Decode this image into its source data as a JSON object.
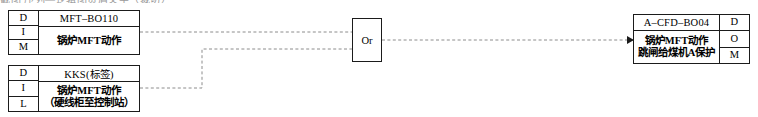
{
  "diagram": {
    "type": "logic-diagram",
    "top_clipped_text": "截图   序列—逻辑图页眉文字（裁切）",
    "blocks": [
      {
        "id": "block-mft-bo110",
        "key_side": "left",
        "keys": [
          "D",
          "I",
          "M"
        ],
        "title": "MFT–BO110",
        "description_lines": [
          "锅炉MFT动作"
        ]
      },
      {
        "id": "block-kks-tag",
        "key_side": "left",
        "keys": [
          "D",
          "I",
          "L"
        ],
        "title": "KKS(标签)",
        "description_lines": [
          "锅炉MFT动作",
          "（硬线柜至控制站）"
        ]
      },
      {
        "id": "block-a-cfd-bo04",
        "key_side": "right",
        "keys": [
          "D",
          "O",
          "M"
        ],
        "title": "A–CFD–BO04",
        "description_lines": [
          "锅炉MFT动作",
          "跳闸给煤机A保护"
        ]
      }
    ],
    "gate": {
      "id": "gate-or",
      "label": "Or",
      "inputs": 2,
      "outputs": 1
    },
    "connections": [
      {
        "from": "block-mft-bo110",
        "to": "gate-or",
        "style": "dashed"
      },
      {
        "from": "block-kks-tag",
        "to": "gate-or",
        "style": "dashed"
      },
      {
        "from": "gate-or",
        "to": "block-a-cfd-bo04",
        "style": "dashed"
      }
    ],
    "colors": {
      "line": "#1b1b1b",
      "wire": "#8c8c8c",
      "background": "#ffffff"
    }
  }
}
